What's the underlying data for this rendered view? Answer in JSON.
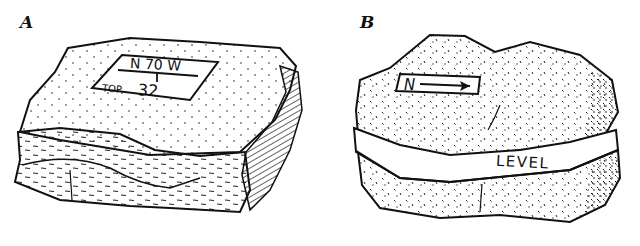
{
  "figure": {
    "panels": [
      {
        "id": "A",
        "label": "A",
        "subject": "rock specimen with strike/dip label",
        "label_box": {
          "line1": "N 70 W",
          "line2_prefix": "TOP",
          "line2_value": "32"
        }
      },
      {
        "id": "B",
        "label": "B",
        "subject": "rock specimen with north arrow and level line",
        "north_box": {
          "letter": "N",
          "arrow": "right-arrow"
        },
        "band_label": "LEVEL"
      }
    ],
    "colors": {
      "ink": "#111111",
      "paper": "#ffffff"
    }
  }
}
